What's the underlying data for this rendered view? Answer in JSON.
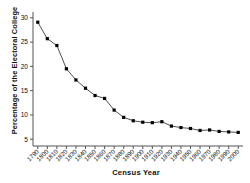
{
  "chart_data": {
    "type": "line",
    "title": "",
    "xlabel": "Census Year",
    "ylabel": "Percentage of the Electoral College",
    "x": [
      1790,
      1800,
      1810,
      1820,
      1830,
      1840,
      1850,
      1860,
      1870,
      1880,
      1890,
      1900,
      1910,
      1920,
      1930,
      1940,
      1950,
      1960,
      1970,
      1980,
      1990,
      2000
    ],
    "xtick_labels": [
      "1790",
      "1800",
      "1810",
      "1820",
      "1830",
      "1840",
      "1850",
      "1860",
      "1870",
      "1880",
      "1890",
      "1900",
      "1910",
      "1920",
      "1930",
      "1940",
      "1950",
      "1960",
      "1970",
      "1980",
      "1990",
      "2000"
    ],
    "values": [
      29.1,
      25.7,
      24.3,
      19.5,
      17.2,
      15.5,
      14.0,
      13.4,
      11.0,
      9.5,
      8.8,
      8.5,
      8.4,
      8.6,
      7.7,
      7.4,
      7.2,
      6.8,
      6.9,
      6.6,
      6.5,
      6.4
    ],
    "ytick_labels": [
      "5",
      "10",
      "15",
      "20",
      "25",
      "30"
    ],
    "ytick_values": [
      5,
      10,
      15,
      20,
      25,
      30
    ],
    "ylim": [
      3.6,
      31.2
    ],
    "xlim": [
      1785,
      2005
    ],
    "grid": false,
    "legend": null,
    "marker": "filled-square",
    "line_color": "#3b3b3b",
    "marker_color": "#000000"
  }
}
